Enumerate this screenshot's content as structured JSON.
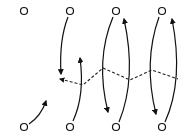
{
  "diagram": {
    "width": 191,
    "height": 140,
    "stroke_color": "#111111",
    "background": "#ffffff",
    "node_radius": 3.5,
    "nodes": [
      {
        "id": "top-1",
        "x": 24,
        "y": 11
      },
      {
        "id": "top-2",
        "x": 70,
        "y": 11
      },
      {
        "id": "top-3",
        "x": 116,
        "y": 11
      },
      {
        "id": "top-4",
        "x": 162,
        "y": 11
      },
      {
        "id": "bottom-1",
        "x": 24,
        "y": 127
      },
      {
        "id": "bottom-2",
        "x": 70,
        "y": 127
      },
      {
        "id": "bottom-3",
        "x": 116,
        "y": 127
      },
      {
        "id": "bottom-4",
        "x": 162,
        "y": 127
      }
    ],
    "arrows": [
      {
        "id": "arrow-top2-down",
        "d": "M 68 17 Q 59 40 61 74",
        "head": "down"
      },
      {
        "id": "arrow-bottom2-up",
        "d": "M 73 121 Q 85 95 80 58",
        "head": "up"
      },
      {
        "id": "arrow-bottom1-up",
        "d": "M 29 124 Q 41 116 46 101",
        "head": "up-right"
      },
      {
        "id": "arrow-top3-down",
        "d": "M 113 17 Q 95 60 108 112",
        "head": "down"
      },
      {
        "id": "arrow-bottom3-up",
        "d": "M 119 122 Q 137 78 124 19",
        "head": "up"
      },
      {
        "id": "arrow-top4-down",
        "d": "M 159 17 Q 143 62 156 114",
        "head": "down"
      },
      {
        "id": "arrow-bottom4-up",
        "d": "M 165 122 Q 184 80 172 19",
        "head": "up"
      }
    ],
    "dashed_path": {
      "id": "dashed-zigzag",
      "points": "60,79 83,85 103,68 130,80 152,70 178,79",
      "head": "left"
    }
  }
}
